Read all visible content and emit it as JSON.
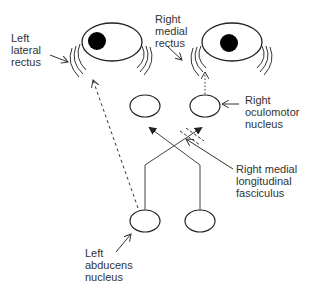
{
  "diagram": {
    "type": "neuroanatomy-schematic",
    "colors": {
      "line": "#333333",
      "pupil": "#000000",
      "label_text": "#333333",
      "background": "#ffffff"
    },
    "labels": {
      "left_lateral_rectus": "Left\nlateral\nrectus",
      "right_medial_rectus": "Right\nmedial\nrectus",
      "right_oculomotor_nucleus": "Right\noculomotor\nnucleus",
      "right_mlf": "Right medial\nlongitudinal\nfasciculus",
      "left_abducens_nucleus": "Left\nabducens\nnucleus"
    },
    "nodes": [
      {
        "id": "left-eye",
        "kind": "eye"
      },
      {
        "id": "right-eye",
        "kind": "eye"
      },
      {
        "id": "left-oculomotor-nucleus",
        "kind": "nucleus"
      },
      {
        "id": "right-oculomotor-nucleus",
        "kind": "nucleus"
      },
      {
        "id": "left-abducens-nucleus",
        "kind": "nucleus"
      },
      {
        "id": "right-abducens-nucleus",
        "kind": "nucleus"
      }
    ],
    "edges": [
      {
        "from": "left-abducens-nucleus",
        "to": "left-eye",
        "style": "dashed",
        "meaning": "abducens nerve to left lateral rectus"
      },
      {
        "from": "right-oculomotor-nucleus",
        "to": "right-eye",
        "style": "dotted",
        "meaning": "oculomotor nerve to right medial rectus"
      },
      {
        "from": "left-abducens-nucleus",
        "to": "right-oculomotor-nucleus",
        "style": "solid",
        "meaning": "crossing fibre via right MLF"
      },
      {
        "from": "right-abducens-nucleus",
        "to": "left-oculomotor-nucleus",
        "style": "solid",
        "meaning": "crossing fibre via left MLF"
      }
    ]
  }
}
